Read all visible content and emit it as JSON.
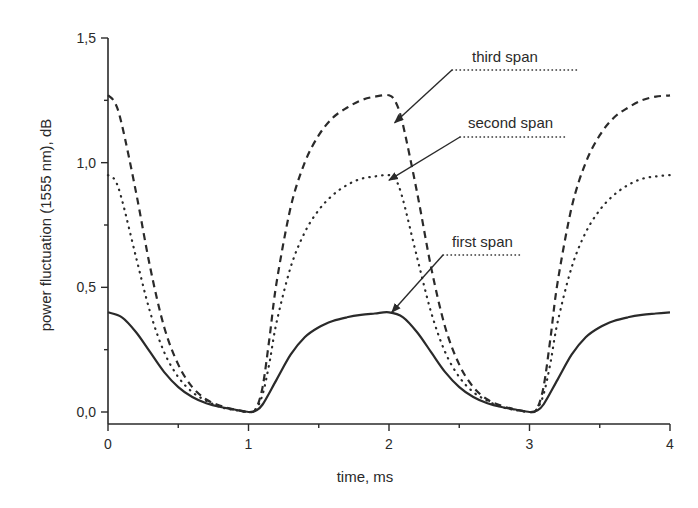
{
  "chart_data": {
    "type": "line",
    "title": "",
    "xlabel": "time, ms",
    "ylabel": "power fluctuation (1555 nm), dB",
    "xlim": [
      0,
      4
    ],
    "ylim": [
      -0.03,
      1.5
    ],
    "x_ticks": [
      "0",
      "1",
      "2",
      "3",
      "4"
    ],
    "y_ticks": [
      "0,0",
      "0,5",
      "1,0",
      "1,5"
    ],
    "grid": false,
    "legend": "inline annotations with arrows",
    "series": [
      {
        "name": "first span",
        "style": "solid",
        "x": [
          0,
          0.1,
          0.2,
          0.3,
          0.4,
          0.5,
          0.6,
          0.7,
          0.8,
          0.9,
          1.0,
          1.05,
          1.1,
          1.2,
          1.3,
          1.4,
          1.5,
          1.6,
          1.7,
          1.8,
          1.9,
          2.0,
          2.1,
          2.2,
          2.3,
          2.4,
          2.5,
          2.6,
          2.7,
          2.8,
          2.9,
          3.0,
          3.05,
          3.1,
          3.2,
          3.3,
          3.4,
          3.5,
          3.6,
          3.7,
          3.8,
          3.9,
          4.0
        ],
        "y": [
          0.4,
          0.38,
          0.32,
          0.24,
          0.16,
          0.1,
          0.06,
          0.035,
          0.02,
          0.01,
          0.0,
          0.005,
          0.03,
          0.13,
          0.23,
          0.3,
          0.34,
          0.365,
          0.38,
          0.39,
          0.395,
          0.4,
          0.38,
          0.32,
          0.24,
          0.16,
          0.1,
          0.06,
          0.035,
          0.02,
          0.01,
          0.0,
          0.005,
          0.03,
          0.13,
          0.23,
          0.3,
          0.34,
          0.365,
          0.38,
          0.39,
          0.395,
          0.4
        ]
      },
      {
        "name": "second span",
        "style": "dotted",
        "x": [
          0,
          0.05,
          0.1,
          0.2,
          0.3,
          0.4,
          0.5,
          0.6,
          0.7,
          0.8,
          0.9,
          1.0,
          1.05,
          1.1,
          1.15,
          1.2,
          1.3,
          1.4,
          1.5,
          1.6,
          1.7,
          1.8,
          1.9,
          2.0,
          2.05,
          2.1,
          2.2,
          2.3,
          2.4,
          2.5,
          2.6,
          2.7,
          2.8,
          2.9,
          3.0,
          3.05,
          3.1,
          3.15,
          3.2,
          3.3,
          3.4,
          3.5,
          3.6,
          3.7,
          3.8,
          3.9,
          4.0
        ],
        "y": [
          0.95,
          0.93,
          0.85,
          0.62,
          0.4,
          0.24,
          0.14,
          0.08,
          0.045,
          0.02,
          0.008,
          0.0,
          0.01,
          0.07,
          0.2,
          0.36,
          0.58,
          0.72,
          0.81,
          0.87,
          0.91,
          0.935,
          0.945,
          0.95,
          0.93,
          0.85,
          0.62,
          0.4,
          0.24,
          0.14,
          0.08,
          0.045,
          0.02,
          0.008,
          0.0,
          0.01,
          0.07,
          0.2,
          0.36,
          0.58,
          0.72,
          0.81,
          0.87,
          0.91,
          0.935,
          0.945,
          0.95
        ]
      },
      {
        "name": "third span",
        "style": "dashed",
        "x": [
          0,
          0.05,
          0.1,
          0.2,
          0.3,
          0.4,
          0.5,
          0.6,
          0.7,
          0.8,
          0.9,
          1.0,
          1.05,
          1.1,
          1.15,
          1.2,
          1.3,
          1.4,
          1.5,
          1.6,
          1.7,
          1.8,
          1.9,
          2.0,
          2.05,
          2.1,
          2.2,
          2.3,
          2.4,
          2.5,
          2.6,
          2.7,
          2.8,
          2.9,
          3.0,
          3.05,
          3.1,
          3.15,
          3.2,
          3.3,
          3.4,
          3.5,
          3.6,
          3.7,
          3.8,
          3.9,
          4.0
        ],
        "y": [
          1.27,
          1.24,
          1.15,
          0.88,
          0.58,
          0.34,
          0.19,
          0.1,
          0.05,
          0.025,
          0.01,
          0.0,
          0.01,
          0.1,
          0.3,
          0.52,
          0.82,
          1.0,
          1.11,
          1.18,
          1.22,
          1.25,
          1.265,
          1.27,
          1.24,
          1.15,
          0.88,
          0.58,
          0.34,
          0.19,
          0.1,
          0.05,
          0.025,
          0.01,
          0.0,
          0.01,
          0.1,
          0.3,
          0.52,
          0.82,
          1.0,
          1.11,
          1.18,
          1.22,
          1.25,
          1.265,
          1.27
        ]
      }
    ],
    "annotations": [
      {
        "text": "third span",
        "arrow_to": [
          2.04,
          1.16
        ]
      },
      {
        "text": "second span",
        "arrow_to": [
          2.0,
          0.93
        ]
      },
      {
        "text": "first span",
        "arrow_to": [
          2.02,
          0.4
        ]
      }
    ]
  },
  "axes": {
    "xlabel": "time, ms",
    "ylabel": "power fluctuation (1555 nm), dB",
    "x_tick_labels": [
      "0",
      "1",
      "2",
      "3",
      "4"
    ],
    "y_tick_labels": [
      "0,0",
      "0,5",
      "1,0",
      "1,5"
    ]
  },
  "labels": {
    "third": "third span",
    "second": "second span",
    "first": "first span"
  },
  "colors": {
    "ink": "#2a2a2a",
    "background": "#ffffff"
  }
}
